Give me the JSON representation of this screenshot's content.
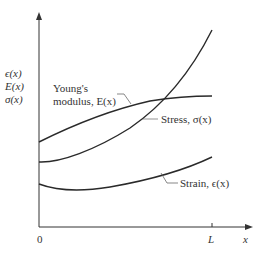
{
  "diagram": {
    "y_axis_labels": [
      "ϵ(x)",
      "E(x)",
      "σ(x)"
    ],
    "x_axis": {
      "origin_label": "0",
      "tick_label": "L",
      "axis_label": "x"
    },
    "curves": [
      {
        "name": "Young's modulus",
        "label_line1": "Young's",
        "label_line2": "modulus, E(x)",
        "color": "#2a2a2a"
      },
      {
        "name": "Stress",
        "label": "Stress, σ(x)",
        "color": "#2a2a2a"
      },
      {
        "name": "Strain",
        "label": "Strain, ϵ(x)",
        "color": "#2a2a2a"
      }
    ]
  }
}
